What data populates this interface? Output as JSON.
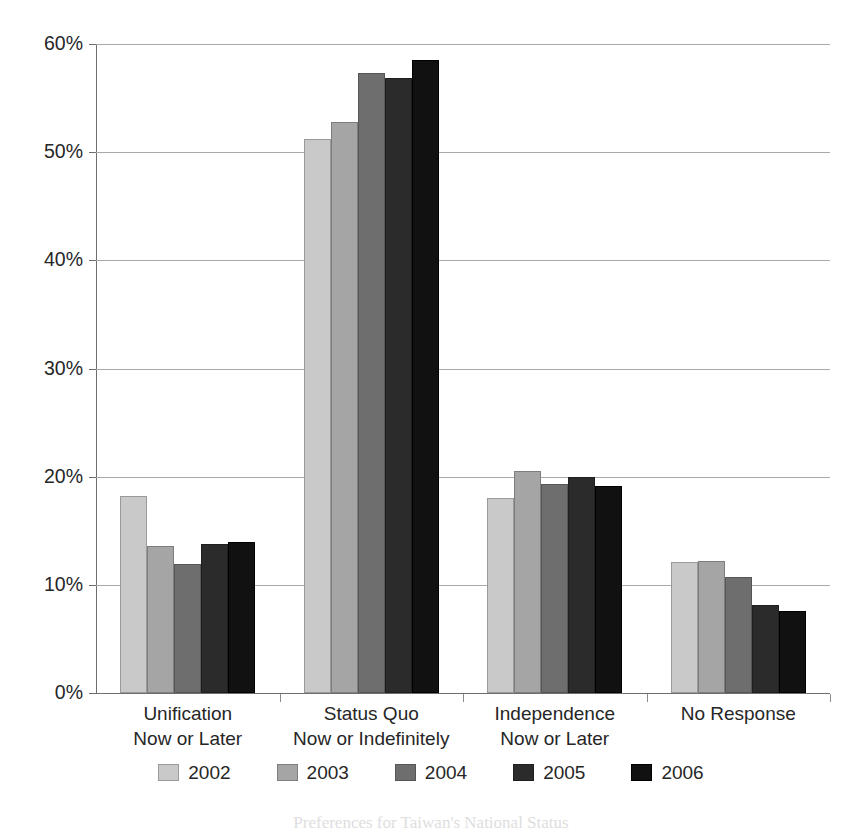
{
  "chart_data": {
    "type": "bar",
    "title": "",
    "subtitle": "",
    "xlabel": "",
    "ylabel": "",
    "ylim": [
      0,
      60
    ],
    "ytick_labels": [
      "60%",
      "50%",
      "40%",
      "30%",
      "20%",
      "10%",
      "0%"
    ],
    "ytick_values": [
      60,
      50,
      40,
      30,
      20,
      10,
      0
    ],
    "grid": true,
    "legend_position": "bottom",
    "categories": [
      "Unification\nNow or Later",
      "Status Quo\nNow or Indefinitely",
      "Independence\nNow or Later",
      "No Response"
    ],
    "category_lines": [
      [
        "Unification",
        "Now or Later"
      ],
      [
        "Status Quo",
        "Now or Indefinitely"
      ],
      [
        "Independence",
        "Now or Later"
      ],
      [
        "No Response",
        ""
      ]
    ],
    "series": [
      {
        "name": "2002",
        "color": "#c9c9c9",
        "values": [
          18.2,
          51.2,
          18.0,
          12.1
        ]
      },
      {
        "name": "2003",
        "color": "#a5a5a5",
        "values": [
          13.6,
          52.8,
          20.5,
          12.2
        ]
      },
      {
        "name": "2004",
        "color": "#6e6e6e",
        "values": [
          11.9,
          57.3,
          19.3,
          10.7
        ]
      },
      {
        "name": "2005",
        "color": "#2b2b2b",
        "values": [
          13.8,
          56.9,
          20.0,
          8.1
        ]
      },
      {
        "name": "2006",
        "color": "#111111",
        "values": [
          14.0,
          58.5,
          19.1,
          7.6
        ]
      }
    ]
  },
  "legend": {
    "items": [
      {
        "label": "2002"
      },
      {
        "label": "2003"
      },
      {
        "label": "2004"
      },
      {
        "label": "2005"
      },
      {
        "label": "2006"
      }
    ]
  },
  "caption": {
    "text": "Preferences for Taiwan's National Status"
  },
  "colors": {
    "axis": "#6d6e71",
    "gridline": "#a7a9ac",
    "text": "#262626"
  }
}
